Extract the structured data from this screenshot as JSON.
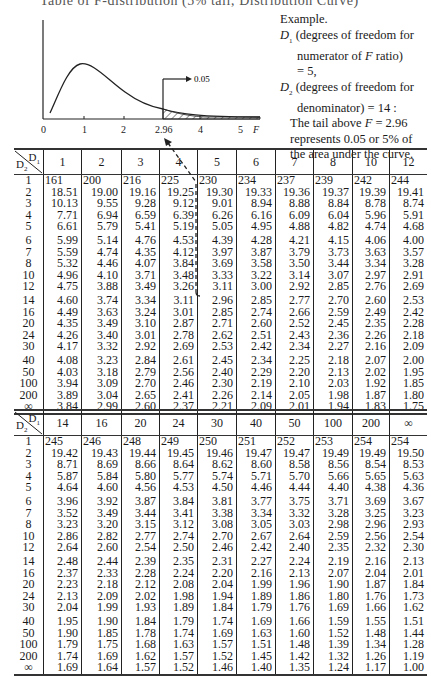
{
  "page": {
    "cut_heading": "Table of F-distribution (5% tail; Distribution Curve)"
  },
  "graph": {
    "axis_ticks": [
      "0",
      "1",
      "2",
      "2.96",
      "4",
      "5"
    ],
    "axis_label": "F",
    "tail_label": "0.05"
  },
  "example": {
    "title": "Example.",
    "d1_symbol": "D",
    "d1_sub": "1",
    "d1_text": "(degrees of freedom for",
    "d1_text2": "numerator of",
    "d1_f": "F",
    "d1_text3": "ratio)",
    "d1_value": "= 5,",
    "d2_symbol": "D",
    "d2_sub": "2",
    "d2_text": "(degrees of freedom for",
    "d2_text2": "denominator) = 14 :",
    "tail_text1": "The tail above",
    "tail_f": "F",
    "tail_text1b": "= 2.96",
    "tail_text2": "represents 0.05 or 5% of",
    "tail_text3": "the area under the curve."
  },
  "table_labels": {
    "d1": "D",
    "d1_sub": "1",
    "d2": "D",
    "d2_sub": "2"
  },
  "d2_rows": [
    "1",
    "2",
    "3",
    "4",
    "5",
    "6",
    "7",
    "8",
    "10",
    "12",
    "14",
    "16",
    "20",
    "24",
    "30",
    "40",
    "50",
    "100",
    "200",
    "∞"
  ],
  "table1": {
    "columns": [
      "1",
      "2",
      "3",
      "4",
      "5",
      "6",
      "7",
      "8",
      "10",
      "12"
    ],
    "rows": [
      [
        "161",
        "200",
        "216",
        "225",
        "230",
        "234",
        "237",
        "239",
        "242",
        "244"
      ],
      [
        "18.51",
        "19.00",
        "19.16",
        "19.25",
        "19.30",
        "19.33",
        "19.36",
        "19.37",
        "19.39",
        "19.41"
      ],
      [
        "10.13",
        "9.55",
        "9.28",
        "9.12",
        "9.01",
        "8.94",
        "8.88",
        "8.84",
        "8.78",
        "8.74"
      ],
      [
        "7.71",
        "6.94",
        "6.59",
        "6.39",
        "6.26",
        "6.16",
        "6.09",
        "6.04",
        "5.96",
        "5.91"
      ],
      [
        "6.61",
        "5.79",
        "5.41",
        "5.19",
        "5.05",
        "4.95",
        "4.88",
        "4.82",
        "4.74",
        "4.68"
      ],
      [
        "5.99",
        "5.14",
        "4.76",
        "4.53",
        "4.39",
        "4.28",
        "4.21",
        "4.15",
        "4.06",
        "4.00"
      ],
      [
        "5.59",
        "4.74",
        "4.35",
        "4.12",
        "3.97",
        "3.87",
        "3.79",
        "3.73",
        "3.63",
        "3.57"
      ],
      [
        "5.32",
        "4.46",
        "4.07",
        "3.84",
        "3.69",
        "3.58",
        "3.50",
        "3.44",
        "3.34",
        "3.28"
      ],
      [
        "4.96",
        "4.10",
        "3.71",
        "3.48",
        "3.33",
        "3.22",
        "3.14",
        "3.07",
        "2.97",
        "2.91"
      ],
      [
        "4.75",
        "3.88",
        "3.49",
        "3.26",
        "3.11",
        "3.00",
        "2.92",
        "2.85",
        "2.76",
        "2.69"
      ],
      [
        "4.60",
        "3.74",
        "3.34",
        "3.11",
        "2.96",
        "2.85",
        "2.77",
        "2.70",
        "2.60",
        "2.53"
      ],
      [
        "4.49",
        "3.63",
        "3.24",
        "3.01",
        "2.85",
        "2.74",
        "2.66",
        "2.59",
        "2.49",
        "2.42"
      ],
      [
        "4.35",
        "3.49",
        "3.10",
        "2.87",
        "2.71",
        "2.60",
        "2.52",
        "2.45",
        "2.35",
        "2.28"
      ],
      [
        "4.26",
        "3.40",
        "3.01",
        "2.78",
        "2.62",
        "2.51",
        "2.43",
        "2.36",
        "2.26",
        "2.18"
      ],
      [
        "4.17",
        "3.32",
        "2.92",
        "2.69",
        "2.53",
        "2.42",
        "2.34",
        "2.27",
        "2.16",
        "2.09"
      ],
      [
        "4.08",
        "3.23",
        "2.84",
        "2.61",
        "2.45",
        "2.34",
        "2.25",
        "2.18",
        "2.07",
        "2.00"
      ],
      [
        "4.03",
        "3.18",
        "2.79",
        "2.56",
        "2.40",
        "2.29",
        "2.20",
        "2.13",
        "2.02",
        "1.95"
      ],
      [
        "3.94",
        "3.09",
        "2.70",
        "2.46",
        "2.30",
        "2.19",
        "2.10",
        "2.03",
        "1.92",
        "1.85"
      ],
      [
        "3.89",
        "3.04",
        "2.65",
        "2.41",
        "2.26",
        "2.14",
        "2.05",
        "1.98",
        "1.87",
        "1.80"
      ],
      [
        "3.84",
        "2.99",
        "2.60",
        "2.37",
        "2.21",
        "2.09",
        "2.01",
        "1.94",
        "1.83",
        "1.75"
      ]
    ]
  },
  "table2": {
    "columns": [
      "14",
      "16",
      "20",
      "24",
      "30",
      "40",
      "50",
      "100",
      "200",
      "∞"
    ],
    "rows": [
      [
        "245",
        "246",
        "248",
        "249",
        "250",
        "251",
        "252",
        "253",
        "254",
        "254"
      ],
      [
        "19.42",
        "19.43",
        "19.44",
        "19.45",
        "19.46",
        "19.47",
        "19.47",
        "19.49",
        "19.49",
        "19.50"
      ],
      [
        "8.71",
        "8.69",
        "8.66",
        "8.64",
        "8.62",
        "8.60",
        "8.58",
        "8.56",
        "8.54",
        "8.53"
      ],
      [
        "5.87",
        "5.84",
        "5.80",
        "5.77",
        "5.74",
        "5.71",
        "5.70",
        "5.66",
        "5.65",
        "5.63"
      ],
      [
        "4.64",
        "4.60",
        "4.56",
        "4.53",
        "4.50",
        "4.46",
        "4.44",
        "4.40",
        "4.38",
        "4.36"
      ],
      [
        "3.96",
        "3.92",
        "3.87",
        "3.84",
        "3.81",
        "3.77",
        "3.75",
        "3.71",
        "3.69",
        "3.67"
      ],
      [
        "3.52",
        "3.49",
        "3.44",
        "3.41",
        "3.38",
        "3.34",
        "3.32",
        "3.28",
        "3.25",
        "3.23"
      ],
      [
        "3.23",
        "3.20",
        "3.15",
        "3.12",
        "3.08",
        "3.05",
        "3.03",
        "2.98",
        "2.96",
        "2.93"
      ],
      [
        "2.86",
        "2.82",
        "2.77",
        "2.74",
        "2.70",
        "2.67",
        "2.64",
        "2.59",
        "2.56",
        "2.54"
      ],
      [
        "2.64",
        "2.60",
        "2.54",
        "2.50",
        "2.46",
        "2.42",
        "2.40",
        "2.35",
        "2.32",
        "2.30"
      ],
      [
        "2.48",
        "2.44",
        "2.39",
        "2.35",
        "2.31",
        "2.27",
        "2.24",
        "2.19",
        "2.16",
        "2.13"
      ],
      [
        "2.37",
        "2.33",
        "2.28",
        "2.24",
        "2.20",
        "2.16",
        "2.13",
        "2.07",
        "2.04",
        "2.01"
      ],
      [
        "2.23",
        "2.18",
        "2.12",
        "2.08",
        "2.04",
        "1.99",
        "1.96",
        "1.90",
        "1.87",
        "1.84"
      ],
      [
        "2.13",
        "2.09",
        "2.02",
        "1.98",
        "1.94",
        "1.89",
        "1.86",
        "1.80",
        "1.76",
        "1.73"
      ],
      [
        "2.04",
        "1.99",
        "1.93",
        "1.89",
        "1.84",
        "1.79",
        "1.76",
        "1.69",
        "1.66",
        "1.62"
      ],
      [
        "1.95",
        "1.90",
        "1.84",
        "1.79",
        "1.74",
        "1.69",
        "1.66",
        "1.59",
        "1.55",
        "1.51"
      ],
      [
        "1.90",
        "1.85",
        "1.78",
        "1.74",
        "1.69",
        "1.63",
        "1.60",
        "1.52",
        "1.48",
        "1.44"
      ],
      [
        "1.79",
        "1.75",
        "1.68",
        "1.63",
        "1.57",
        "1.51",
        "1.48",
        "1.39",
        "1.34",
        "1.28"
      ],
      [
        "1.74",
        "1.69",
        "1.62",
        "1.57",
        "1.52",
        "1.45",
        "1.42",
        "1.32",
        "1.26",
        "1.19"
      ],
      [
        "1.69",
        "1.64",
        "1.57",
        "1.52",
        "1.46",
        "1.40",
        "1.35",
        "1.24",
        "1.17",
        "1.00"
      ]
    ]
  }
}
